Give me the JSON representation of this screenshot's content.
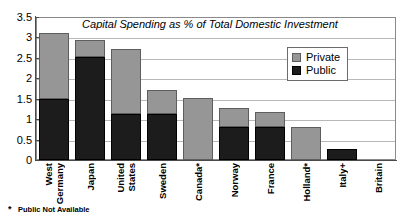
{
  "chart_data": {
    "type": "bar",
    "stacked": true,
    "title": "Capital Spending as % of Total Domestic Investment",
    "xlabel": "",
    "ylabel": "",
    "ylim": [
      0,
      3.5
    ],
    "yticks": [
      "0",
      "0.5",
      "1",
      "1.5",
      "2",
      "2.5",
      "3",
      "3.5"
    ],
    "ytick_values": [
      0,
      0.5,
      1,
      1.5,
      2,
      2.5,
      3,
      3.5
    ],
    "grid": true,
    "legend_position": "inside-top-right",
    "categories": [
      "West Germany",
      "Japan",
      "United States",
      "Sweden",
      "Canada*",
      "Norway",
      "France",
      "Holland*",
      "Italy+",
      "Britain"
    ],
    "category_lines": [
      [
        "West",
        "Germany"
      ],
      [
        "Japan"
      ],
      [
        "United",
        "States"
      ],
      [
        "Sweden"
      ],
      [
        "Canada*"
      ],
      [
        "Norway"
      ],
      [
        "France"
      ],
      [
        "Holland*"
      ],
      [
        "Italy+"
      ],
      [
        "Britain"
      ]
    ],
    "series": [
      {
        "name": "Public",
        "color": "#1c1c1c",
        "values": [
          1.5,
          2.53,
          1.12,
          1.12,
          0,
          0.82,
          0.82,
          0,
          0.28,
          0
        ]
      },
      {
        "name": "Private",
        "color": "#969696",
        "values": [
          1.6,
          0.4,
          1.6,
          0.6,
          1.52,
          0.46,
          0.36,
          0.8,
          0,
          0
        ]
      }
    ],
    "totals": [
      3.1,
      2.93,
      2.72,
      1.72,
      1.52,
      1.28,
      1.18,
      0.8,
      0.28,
      0
    ],
    "annotations": [
      "* Public Not Available"
    ]
  },
  "legend": {
    "items": [
      {
        "label": "Private",
        "color": "#969696"
      },
      {
        "label": "Public",
        "color": "#1c1c1c"
      }
    ]
  },
  "footnote": {
    "marker": "*",
    "text": "Public Not Available"
  }
}
